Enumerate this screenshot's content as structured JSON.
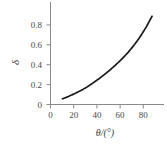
{
  "chart_data": {
    "type": "line",
    "title": "",
    "subtitle": "",
    "xlabel": "θ/(°)",
    "ylabel": "δ",
    "xlim": [
      0,
      95
    ],
    "ylim": [
      0,
      0.9
    ],
    "grid": false,
    "legend": null,
    "xticks": [
      "0",
      "20",
      "40",
      "60",
      "80"
    ],
    "xtick_values": [
      0,
      20,
      40,
      60,
      80
    ],
    "yticks": [
      "0",
      "0.2",
      "0.4",
      "0.6",
      "0.8"
    ],
    "ytick_values": [
      0,
      0.2,
      0.4,
      0.6,
      0.8
    ],
    "series": [
      {
        "name": "delta",
        "color": "#1a1a1a",
        "x": [
          10,
          15,
          20,
          25,
          30,
          35,
          40,
          45,
          50,
          55,
          60,
          65,
          70,
          75,
          80,
          85
        ],
        "values": [
          0.05,
          0.07,
          0.095,
          0.12,
          0.15,
          0.185,
          0.222,
          0.262,
          0.305,
          0.352,
          0.402,
          0.458,
          0.522,
          0.594,
          0.678,
          0.775
        ]
      }
    ]
  },
  "axes": {
    "line_color": "#808080",
    "curve_color": "#1a1a1a",
    "tick_color": "#808080",
    "label_color": "#4a4a4a"
  }
}
